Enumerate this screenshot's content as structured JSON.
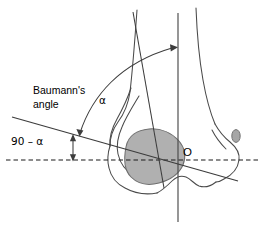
{
  "figure": {
    "background_color": "#ffffff",
    "width": 263,
    "height": 235
  },
  "labels": {
    "baumanns_line1": "Baumann's",
    "baumanns_line2": "angle",
    "alpha": "α",
    "ninety_minus_alpha": "90 – α",
    "origin": "O"
  },
  "colors": {
    "outline": "#4a4a4a",
    "line": "#3c3c3c",
    "dashed": "#1a1a1a",
    "shaded_fill": "#b0b0b0",
    "shaded_stroke": "#6e6e6e",
    "epicondyle_fill": "#a6a6a6",
    "text": "#000000"
  },
  "elements": {
    "humerus_outline_name": "humerus-bone-outline",
    "capitellum_name": "capitellum-shaded-region",
    "epicondyle_name": "lateral-epicondyle-oval",
    "vertical_axis_name": "vertical-reference-axis",
    "horizontal_axis_name": "horizontal-dashed-axis",
    "shaft_axis_name": "humeral-shaft-axis-line",
    "baumann_line_name": "baumanns-physeal-line",
    "alpha_arc_name": "alpha-angle-arc",
    "complement_arrow_name": "ninety-minus-alpha-arrow"
  },
  "geometry": {
    "vertical_axis_x": 178,
    "horizontal_axis_y": 160,
    "origin_point": [
      178,
      160
    ],
    "shaft_axis": [
      [
        133,
        12
      ],
      [
        163,
        185
      ]
    ],
    "baumann_line": [
      [
        12,
        117
      ],
      [
        238,
        181
      ]
    ],
    "alpha_arc_endpoint": [
      178,
      48
    ]
  }
}
